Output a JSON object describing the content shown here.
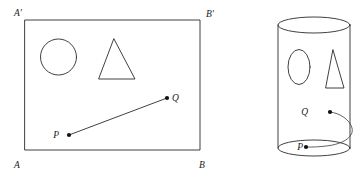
{
  "figure": {
    "stroke_color": "#2b2b2b",
    "dot_color": "#111111",
    "background_color": "#ffffff",
    "width": 362,
    "height": 175
  },
  "left_panel": {
    "name": "unrolled-rectangle",
    "corner_labels": {
      "top_left": "A'",
      "top_right": "B'",
      "bottom_left": "A",
      "bottom_right": "B"
    },
    "rectangle": {
      "x": 25,
      "y": 20,
      "width": 175,
      "height": 130
    },
    "shapes": [
      {
        "name": "circle",
        "type": "circle",
        "cx": 58.5,
        "cy": 57,
        "r": 18
      },
      {
        "name": "triangle",
        "type": "polygon",
        "points": "114,39 135,79 99,79"
      }
    ],
    "points": [
      {
        "label": "P",
        "x": 69,
        "y": 135,
        "label_x": 59,
        "label_y": 138
      },
      {
        "label": "Q",
        "x": 167,
        "y": 98,
        "label_x": 172,
        "label_y": 101
      }
    ],
    "segment": {
      "from": "P",
      "to": "Q",
      "type": "straight-line"
    }
  },
  "right_panel": {
    "name": "rolled-cylinder",
    "cylinder": {
      "cx": 314,
      "top_y": 25,
      "bottom_y": 148,
      "rx": 36,
      "ry": 8
    },
    "shapes": [
      {
        "name": "ellipse",
        "type": "ellipse",
        "cx": 299,
        "cy": 67,
        "rx": 11,
        "ry": 17.5
      },
      {
        "name": "triangle",
        "type": "polygon",
        "points": "333,50 344,88 326,88"
      }
    ],
    "points": [
      {
        "label": "P",
        "x": 306,
        "y": 147,
        "label_x": 296,
        "label_y": 150
      },
      {
        "label": "Q",
        "x": 330,
        "y": 112,
        "label_x": 310,
        "label_y": 115
      }
    ],
    "segment": {
      "from": "Q",
      "to": "P",
      "type": "helix-curve-wrapping-behind"
    }
  }
}
